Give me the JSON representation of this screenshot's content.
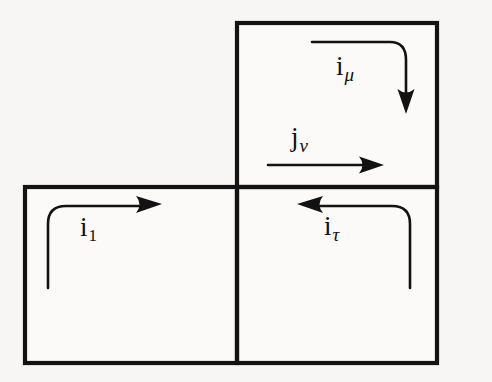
{
  "figure": {
    "background_color": "#f7f6f4",
    "ink_color": "#121212"
  },
  "cells": [
    {
      "name": "top-right-cell",
      "x": 237,
      "y": 23,
      "width": 200,
      "height": 164
    },
    {
      "name": "bottom-left-cell",
      "x": 25,
      "y": 187,
      "width": 212,
      "height": 176
    },
    {
      "name": "bottom-right-cell",
      "x": 237,
      "y": 187,
      "width": 200,
      "height": 176
    }
  ],
  "arrows": [
    {
      "name": "arrow-i-mu",
      "label": "i",
      "subscript": "μ",
      "subscript_kind": "greek",
      "shape": "elbow-right-down",
      "direction": "down",
      "start": [
        312,
        42
      ],
      "end": [
        406,
        108
      ],
      "label_position": [
        336,
        53
      ]
    },
    {
      "name": "arrow-j-nu",
      "label": "j",
      "subscript": "ν",
      "subscript_kind": "greek",
      "shape": "straight",
      "direction": "right",
      "start": [
        268,
        165
      ],
      "end": [
        378,
        165
      ],
      "label_position": [
        291,
        124
      ]
    },
    {
      "name": "arrow-i-one",
      "label": "i",
      "subscript": "1",
      "subscript_kind": "digit",
      "shape": "elbow-up-right",
      "direction": "right",
      "start": [
        48,
        288
      ],
      "end": [
        160,
        205
      ],
      "label_position": [
        80,
        214
      ]
    },
    {
      "name": "arrow-i-tau",
      "label": "i",
      "subscript": "τ",
      "subscript_kind": "greek",
      "shape": "elbow-up-left",
      "direction": "left",
      "start": [
        410,
        288
      ],
      "end": [
        300,
        205
      ],
      "label_position": [
        324,
        213
      ]
    }
  ],
  "labels": {
    "i_mu": {
      "base": "i",
      "sub": "μ"
    },
    "j_nu": {
      "base": "j",
      "sub": "ν"
    },
    "i_one": {
      "base": "i",
      "sub": "1"
    },
    "i_tau": {
      "base": "i",
      "sub": "τ"
    }
  }
}
